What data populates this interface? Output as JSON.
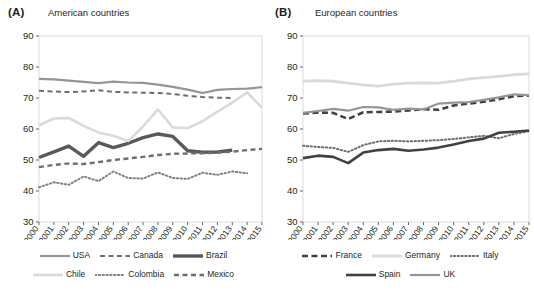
{
  "figure": {
    "panels": [
      {
        "tag": "(A)",
        "title": "American countries",
        "legend_rows": [
          [
            {
              "label": "USA",
              "style": "solid",
              "color": "#939597",
              "width": 2.2
            },
            {
              "label": "Canada",
              "style": "dashed",
              "color": "#6d6e71",
              "width": 2.0
            },
            {
              "label": "Brazil",
              "style": "solid",
              "color": "#58595b",
              "width": 3.4
            }
          ],
          [
            {
              "label": "Chile",
              "style": "solid",
              "color": "#d9dadb",
              "width": 2.6
            },
            {
              "label": "Colombia",
              "style": "dotted",
              "color": "#808285",
              "width": 2.0
            },
            {
              "label": "Mexico",
              "style": "dashed",
              "color": "#6d6e71",
              "width": 2.4
            }
          ]
        ]
      },
      {
        "tag": "(B)",
        "title": "European countries",
        "legend_rows": [
          [
            {
              "label": "France",
              "style": "dashed",
              "color": "#404041",
              "width": 2.6
            },
            {
              "label": "Germany",
              "style": "solid",
              "color": "#d9dadb",
              "width": 2.8
            },
            {
              "label": "Italy",
              "style": "dotted",
              "color": "#6d6e71",
              "width": 2.0
            }
          ],
          [
            {
              "label": "Spain",
              "style": "solid",
              "color": "#414042",
              "width": 2.6
            },
            {
              "label": "UK",
              "style": "solid",
              "color": "#939597",
              "width": 2.2
            }
          ]
        ]
      }
    ]
  },
  "chart_data": [
    {
      "type": "line",
      "panel": "(A)",
      "title": "American countries",
      "xlabel": "",
      "ylabel": "",
      "x": [
        2000,
        2001,
        2002,
        2003,
        2004,
        2005,
        2006,
        2007,
        2008,
        2009,
        2010,
        2011,
        2012,
        2013,
        2014,
        2015
      ],
      "xticklabels": [
        "2000",
        "2001",
        "2002",
        "2003",
        "2004",
        "2005",
        "2006",
        "2007",
        "2008",
        "2009",
        "2010",
        "2011",
        "2012",
        "2013",
        "2014",
        "2015"
      ],
      "ylim": [
        30,
        90
      ],
      "yticks": [
        30,
        40,
        50,
        60,
        70,
        80,
        90
      ],
      "grid": false,
      "legend_position": "below",
      "series": [
        {
          "name": "USA",
          "style": "solid",
          "color": "#939597",
          "width": 2.2,
          "values": [
            76.2,
            76.0,
            75.6,
            75.2,
            74.8,
            75.3,
            75.0,
            74.9,
            74.3,
            73.6,
            72.7,
            71.6,
            72.6,
            72.9,
            73.0,
            73.5
          ]
        },
        {
          "name": "Canada",
          "style": "dashed",
          "color": "#6d6e71",
          "width": 2.0,
          "values": [
            72.3,
            72.1,
            71.9,
            72.1,
            72.5,
            72.0,
            71.8,
            71.7,
            71.6,
            71.3,
            70.7,
            70.3,
            70.1,
            70.0,
            null,
            null
          ]
        },
        {
          "name": "Brazil",
          "style": "solid",
          "color": "#58595b",
          "width": 3.4,
          "values": [
            50.8,
            52.6,
            54.5,
            51.2,
            55.6,
            54.0,
            55.4,
            57.2,
            58.4,
            57.6,
            53.0,
            52.5,
            52.6,
            53.2,
            null,
            null
          ]
        },
        {
          "name": "Chile",
          "style": "solid",
          "color": "#d9dadb",
          "width": 2.6,
          "values": [
            61.2,
            63.4,
            63.6,
            61.0,
            58.9,
            57.8,
            56.1,
            60.8,
            66.3,
            60.5,
            60.3,
            62.5,
            65.6,
            68.5,
            71.8,
            66.8
          ]
        },
        {
          "name": "Colombia",
          "style": "dotted",
          "color": "#808285",
          "width": 2.0,
          "values": [
            41.2,
            42.8,
            42.0,
            44.7,
            43.2,
            46.3,
            44.2,
            44.0,
            46.0,
            44.2,
            43.9,
            45.9,
            45.2,
            46.3,
            45.7,
            null
          ]
        },
        {
          "name": "Mexico",
          "style": "dashed",
          "color": "#6d6e71",
          "width": 2.4,
          "values": [
            47.7,
            48.4,
            48.9,
            48.7,
            49.3,
            50.0,
            50.5,
            51.0,
            51.6,
            52.0,
            52.1,
            52.2,
            52.4,
            52.7,
            53.2,
            53.6
          ]
        }
      ]
    },
    {
      "type": "line",
      "panel": "(B)",
      "title": "European countries",
      "xlabel": "",
      "ylabel": "",
      "x": [
        2000,
        2001,
        2002,
        2003,
        2004,
        2005,
        2006,
        2007,
        2008,
        2009,
        2010,
        2011,
        2012,
        2013,
        2014,
        2015
      ],
      "xticklabels": [
        "2000",
        "2001",
        "2002",
        "2003",
        "2004",
        "2005",
        "2006",
        "2007",
        "2008",
        "2009",
        "2010",
        "2011",
        "2012",
        "2013",
        "2014",
        "2015"
      ],
      "ylim": [
        30,
        90
      ],
      "yticks": [
        30,
        40,
        50,
        60,
        70,
        80,
        90
      ],
      "grid": false,
      "legend_position": "below",
      "series": [
        {
          "name": "France",
          "style": "dashed",
          "color": "#404041",
          "width": 2.6,
          "values": [
            65.0,
            65.3,
            65.2,
            63.2,
            65.4,
            65.5,
            65.6,
            66.0,
            66.4,
            66.2,
            67.6,
            68.2,
            68.8,
            69.6,
            70.6,
            70.8
          ]
        },
        {
          "name": "Germany",
          "style": "solid",
          "color": "#d9dadb",
          "width": 2.8,
          "values": [
            75.4,
            75.6,
            75.4,
            74.8,
            74.2,
            73.8,
            74.5,
            74.8,
            74.9,
            74.8,
            75.4,
            76.2,
            76.6,
            77.0,
            77.5,
            77.8
          ]
        },
        {
          "name": "Italy",
          "style": "dotted",
          "color": "#6d6e71",
          "width": 2.0,
          "values": [
            54.6,
            54.2,
            53.9,
            52.6,
            54.8,
            56.0,
            56.2,
            56.0,
            56.2,
            56.4,
            56.8,
            57.3,
            57.8,
            57.0,
            58.4,
            59.3
          ]
        },
        {
          "name": "Spain",
          "style": "solid",
          "color": "#414042",
          "width": 2.6,
          "values": [
            50.6,
            51.4,
            51.0,
            49.0,
            52.4,
            53.2,
            53.6,
            53.0,
            53.4,
            54.0,
            55.0,
            56.1,
            56.9,
            58.8,
            59.1,
            59.5
          ]
        },
        {
          "name": "UK",
          "style": "solid",
          "color": "#939597",
          "width": 2.2,
          "values": [
            65.2,
            65.8,
            66.5,
            65.9,
            67.1,
            67.0,
            66.2,
            66.6,
            66.3,
            68.2,
            68.5,
            68.7,
            69.4,
            70.2,
            71.2,
            70.9
          ]
        }
      ]
    }
  ]
}
